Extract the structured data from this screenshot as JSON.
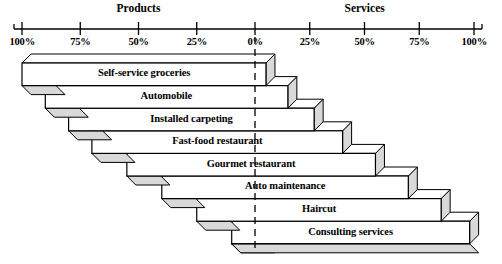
{
  "chart_data": {
    "type": "bar",
    "title": "",
    "subtitle": "",
    "xlabel": "",
    "ylabel": "",
    "orientation": "horizontal",
    "style": "diverging-3d-stacked",
    "grid": false,
    "legend_position": "top",
    "groups": [
      {
        "name": "Products",
        "side": "left"
      },
      {
        "name": "Services",
        "side": "right"
      }
    ],
    "axis": {
      "left_ticks": [
        "100%",
        "75%",
        "50%",
        "25%"
      ],
      "center_tick": "0%",
      "right_ticks": [
        "25%",
        "50%",
        "75%",
        "100%"
      ],
      "tick_values_left": [
        100,
        75,
        50,
        25
      ],
      "tick_values_right": [
        25,
        50,
        75,
        100
      ],
      "center_value": 0,
      "range_left": [
        0,
        100
      ],
      "range_right": [
        0,
        100
      ]
    },
    "categories": [
      "Self-service groceries",
      "Automobile",
      "Installed carpeting",
      "Fast-food restaurant",
      "Gourmet restaurant",
      "Auto maintenance",
      "Haircut",
      "Consulting services"
    ],
    "series": [
      {
        "name": "Products",
        "values": [
          100,
          90,
          80,
          70,
          55,
          40,
          25,
          10
        ]
      },
      {
        "name": "Services",
        "values": [
          5,
          15,
          27,
          40,
          55,
          70,
          85,
          98
        ]
      }
    ]
  },
  "axis": {
    "left_ticks": [
      {
        "label": "100%",
        "value": 100
      },
      {
        "label": "75%",
        "value": 75
      },
      {
        "label": "50%",
        "value": 50
      },
      {
        "label": "25%",
        "value": 25
      }
    ],
    "center": {
      "label": "0%",
      "value": 0
    },
    "right_ticks": [
      {
        "label": "25%",
        "value": 25
      },
      {
        "label": "50%",
        "value": 50
      },
      {
        "label": "75%",
        "value": 75
      },
      {
        "label": "100%",
        "value": 100
      }
    ]
  },
  "headers": {
    "products": "Products",
    "services": "Services"
  },
  "bars": [
    {
      "label": "Self-service groceries",
      "products": 100,
      "services": 5
    },
    {
      "label": "Automobile",
      "products": 90,
      "services": 15
    },
    {
      "label": "Installed carpeting",
      "products": 80,
      "services": 27
    },
    {
      "label": "Fast-food restaurant",
      "products": 70,
      "services": 40
    },
    {
      "label": "Gourmet restaurant",
      "products": 55,
      "services": 55
    },
    {
      "label": "Auto maintenance",
      "products": 40,
      "services": 70
    },
    {
      "label": "Haircut",
      "products": 25,
      "services": 85
    },
    {
      "label": "Consulting services",
      "products": 10,
      "services": 98
    }
  ],
  "colors": {
    "line": "#000000",
    "face": "#ffffff",
    "shade": "#d9d9d9",
    "text": "#000000"
  }
}
